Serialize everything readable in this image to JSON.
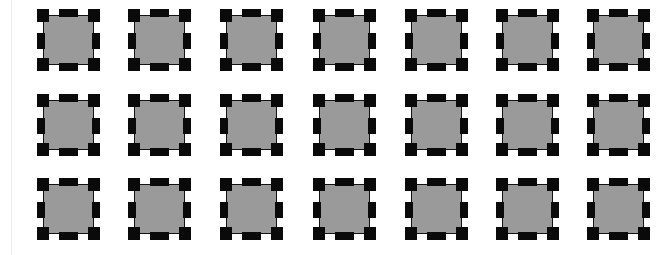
{
  "canvas": {
    "width": 672,
    "height": 255,
    "background": "#ffffff"
  },
  "guide_line": {
    "x": 11,
    "color": "#ededed"
  },
  "tile_style": {
    "fill_color": "#9a9a9a",
    "block_color": "#0a0a0a",
    "width": 63,
    "height": 62
  },
  "columns_x": [
    37,
    128,
    220,
    313,
    405,
    496,
    587
  ],
  "rows_y": [
    9,
    94,
    178
  ],
  "grid": {
    "rows": 3,
    "cols": 7,
    "count": 21
  }
}
